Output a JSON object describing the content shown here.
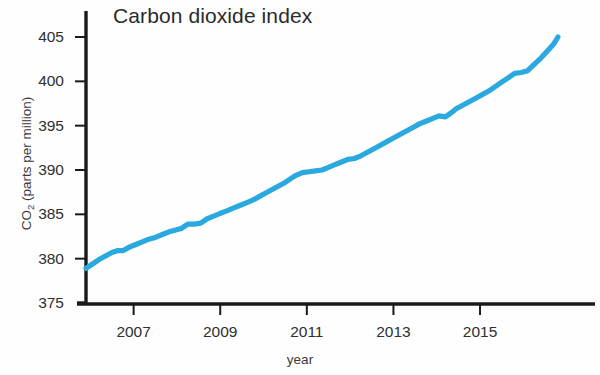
{
  "chart_data": {
    "type": "line",
    "title": "Carbon dioxide index",
    "xlabel": "year",
    "ylabel_main": "CO",
    "ylabel_sub": "2",
    "ylabel_rest": " (parts per million)",
    "ylabel_full": "CO2 (parts per million)",
    "xlim": [
      2005.9,
      2016.8
    ],
    "ylim": [
      375,
      406.5
    ],
    "grid": false,
    "legend": null,
    "line_color": "#29a9e0",
    "axis_color": "#1a1a1a",
    "xticks": [
      2007,
      2009,
      2011,
      2013,
      2015
    ],
    "xtick_labels": [
      "2007",
      "2009",
      "2011",
      "2013",
      "2015"
    ],
    "yticks": [
      375,
      380,
      385,
      390,
      395,
      400,
      405
    ],
    "ytick_labels": [
      "375",
      "380",
      "385",
      "390",
      "395",
      "400",
      "405"
    ],
    "series": [
      {
        "name": "CO2 concentration",
        "x": [
          2005.9,
          2006.05,
          2006.2,
          2006.35,
          2006.5,
          2006.62,
          2006.75,
          2006.9,
          2007.05,
          2007.2,
          2007.35,
          2007.5,
          2007.65,
          2007.8,
          2007.95,
          2008.1,
          2008.25,
          2008.4,
          2008.55,
          2008.7,
          2008.85,
          2009.0,
          2009.15,
          2009.3,
          2009.45,
          2009.6,
          2009.75,
          2009.9,
          2010.05,
          2010.2,
          2010.35,
          2010.5,
          2010.62,
          2010.75,
          2010.9,
          2011.05,
          2011.2,
          2011.35,
          2011.5,
          2011.65,
          2011.8,
          2011.95,
          2012.1,
          2012.25,
          2012.4,
          2012.55,
          2012.7,
          2012.85,
          2013.0,
          2013.15,
          2013.3,
          2013.45,
          2013.6,
          2013.75,
          2013.9,
          2014.05,
          2014.2,
          2014.32,
          2014.45,
          2014.6,
          2014.75,
          2014.9,
          2015.05,
          2015.2,
          2015.35,
          2015.5,
          2015.65,
          2015.8,
          2015.95,
          2016.1,
          2016.25,
          2016.4,
          2016.55,
          2016.7,
          2016.8
        ],
        "y": [
          378.9,
          379.4,
          379.9,
          380.3,
          380.7,
          380.9,
          380.9,
          381.3,
          381.6,
          381.9,
          382.2,
          382.4,
          382.7,
          383.0,
          383.2,
          383.4,
          383.9,
          383.9,
          384.0,
          384.5,
          384.8,
          385.1,
          385.4,
          385.7,
          386.0,
          386.3,
          386.6,
          387.0,
          387.4,
          387.8,
          388.2,
          388.6,
          389.0,
          389.4,
          389.7,
          389.8,
          389.9,
          390.0,
          390.3,
          390.6,
          390.9,
          391.2,
          391.3,
          391.6,
          392.0,
          392.4,
          392.8,
          393.2,
          393.6,
          394.0,
          394.4,
          394.8,
          395.2,
          395.5,
          395.8,
          396.1,
          396.0,
          396.4,
          396.9,
          397.3,
          397.7,
          398.1,
          398.5,
          398.9,
          399.4,
          399.9,
          400.4,
          400.9,
          401.0,
          401.2,
          401.9,
          402.6,
          403.4,
          404.2,
          405.0
        ],
        "start_value": 378.9,
        "end_value": 405.0,
        "units": "parts per million"
      }
    ]
  },
  "chart": {
    "plot": {
      "x0": 86,
      "x1": 595,
      "y_top": 11,
      "y_bottom": 304,
      "x_axis_year_min": 2005.9,
      "x_axis_year_max": 2016.8,
      "px_per_year": 43.3,
      "y_val_top": 405,
      "y_val_bottom": 375,
      "y_px_top": 37,
      "y_px_bottom": 303
    }
  }
}
